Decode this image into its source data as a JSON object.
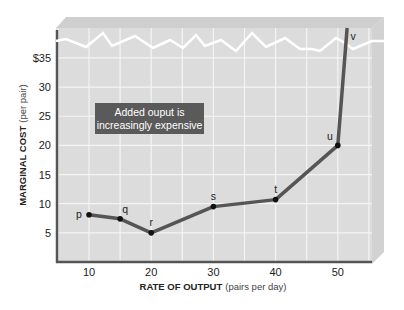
{
  "chart_data": {
    "type": "line",
    "title": "",
    "xlabel": "RATE OF OUTPUT",
    "xlabel_unit": "(pairs per day)",
    "ylabel": "MARGINAL COST",
    "ylabel_unit": "(per pair)",
    "xlim": [
      3,
      55
    ],
    "ylim": [
      0,
      35
    ],
    "x_ticks": [
      10,
      20,
      30,
      40,
      50
    ],
    "y_ticks": [
      "5",
      "10",
      "15",
      "20",
      "25",
      "30",
      "$35"
    ],
    "y_tick_values": [
      5,
      10,
      15,
      20,
      25,
      30,
      35
    ],
    "grid": true,
    "axis_break": "zigzag above $35",
    "annotation": "Added ouput is increasingly expensive",
    "series": [
      {
        "name": "Marginal cost",
        "points": [
          {
            "label": "p",
            "x": 10,
            "y": 8.1
          },
          {
            "label": "q",
            "x": 15,
            "y": 7.4
          },
          {
            "label": "r",
            "x": 20,
            "y": 5.0
          },
          {
            "label": "s",
            "x": 30,
            "y": 9.5
          },
          {
            "label": "t",
            "x": 40,
            "y": 10.7
          },
          {
            "label": "u",
            "x": 50,
            "y": 20.0
          },
          {
            "label": "v",
            "x": 51.5,
            "y": null,
            "note": "off-scale above $35"
          }
        ]
      }
    ],
    "colors": {
      "plot_bg": "#dcdcdc",
      "grid": "#f4f4f4",
      "line": "#555555",
      "marker": "#111111",
      "annotation_bg": "#5a5a5a",
      "axis": "#555555"
    }
  }
}
